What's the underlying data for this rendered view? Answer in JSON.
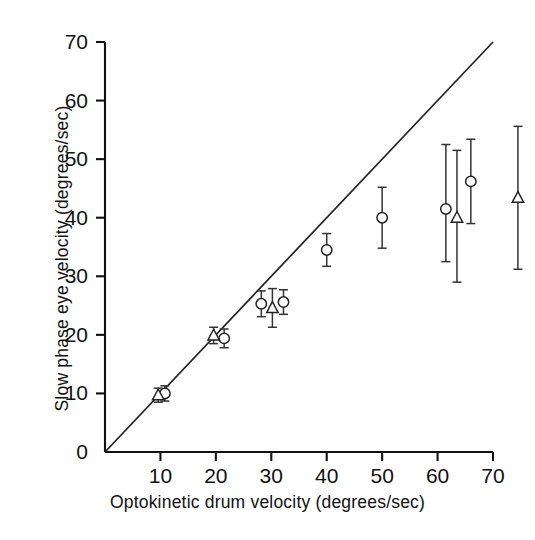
{
  "chart_data": {
    "type": "scatter",
    "title": "",
    "xlabel": "Optokinetic drum velocity (degrees/sec)",
    "ylabel": "Slow phase eye velocity (degrees/sec)",
    "xlim": [
      0,
      70
    ],
    "ylim": [
      0,
      70
    ],
    "xticks": [
      0,
      10,
      20,
      30,
      40,
      50,
      60,
      70
    ],
    "yticks": [
      0,
      10,
      20,
      30,
      40,
      50,
      60,
      70
    ],
    "xticklabels": [
      "",
      "10",
      "20",
      "30",
      "40",
      "50",
      "60",
      "70"
    ],
    "yticklabels": [
      "0",
      "10",
      "20",
      "30",
      "40",
      "50",
      "60",
      "70"
    ],
    "grid": false,
    "legend": "none",
    "reference_line": {
      "name": "unity-line",
      "description": "1:1 line of perfect gain",
      "x": [
        0,
        70
      ],
      "y": [
        0,
        70
      ]
    },
    "series": [
      {
        "name": "Open circle group",
        "marker": "open-circle",
        "points": [
          {
            "x": 10.8,
            "y": 10.0,
            "yerr_low": 1.3,
            "yerr_high": 1.3
          },
          {
            "x": 21.5,
            "y": 19.4,
            "yerr_low": 1.6,
            "yerr_high": 1.6
          },
          {
            "x": 28.2,
            "y": 25.3,
            "yerr_low": 2.2,
            "yerr_high": 2.2
          },
          {
            "x": 32.2,
            "y": 25.6,
            "yerr_low": 2.1,
            "yerr_high": 2.1
          },
          {
            "x": 40.0,
            "y": 34.5,
            "yerr_low": 2.8,
            "yerr_high": 2.8
          },
          {
            "x": 50.0,
            "y": 40.0,
            "yerr_low": 5.2,
            "yerr_high": 5.2
          },
          {
            "x": 61.5,
            "y": 41.5,
            "yerr_low": 9.0,
            "yerr_high": 11.0
          },
          {
            "x": 66.0,
            "y": 46.2,
            "yerr_low": 7.2,
            "yerr_high": 7.2
          }
        ]
      },
      {
        "name": "Open triangle group",
        "marker": "open-triangle",
        "points": [
          {
            "x": 9.6,
            "y": 9.7,
            "yerr_low": 1.2,
            "yerr_high": 1.2
          },
          {
            "x": 19.6,
            "y": 19.9,
            "yerr_low": 1.4,
            "yerr_high": 1.4
          },
          {
            "x": 30.2,
            "y": 24.6,
            "yerr_low": 3.3,
            "yerr_high": 3.3
          },
          {
            "x": 63.5,
            "y": 40.0,
            "yerr_low": 11.0,
            "yerr_high": 11.5
          },
          {
            "x": 74.5,
            "y": 43.4,
            "yerr_low": 12.2,
            "yerr_high": 12.2
          }
        ]
      }
    ],
    "colors": {
      "axis": "#111111",
      "marker_stroke": "#222222",
      "marker_fill": "#ffffff",
      "errorbar": "#333333",
      "reference_line": "#222222",
      "background": "#ffffff"
    }
  }
}
